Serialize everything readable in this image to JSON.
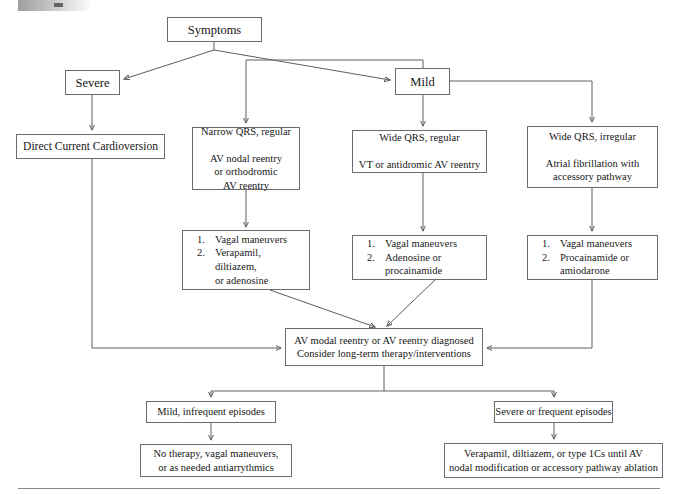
{
  "figure": {
    "domain": "clinical-algorithm-flowchart",
    "title_text": "",
    "footer_rule": true
  },
  "nodes": {
    "symptoms": {
      "label": "Symptoms"
    },
    "severe": {
      "label": "Severe"
    },
    "mild": {
      "label": "Mild"
    },
    "cardioversion": {
      "label": "Direct Current Cardioversion"
    },
    "narrow_qrs": {
      "label": "Narrow QRS, regular\n\nAV nodal reentry\nor orthodromic\nAV reentry"
    },
    "wide_qrs_regular": {
      "label": "Wide QRS, regular\n\nVT or antidromic AV reentry"
    },
    "wide_qrs_irregular": {
      "label": "Wide QRS, irregular\n\nAtrial fibrillation with\naccessory pathway"
    },
    "diagnosis": {
      "label": "AV modal reentry or AV reentry diagnosed\nConsider long-term therapy/interventions"
    },
    "mild_infrequent": {
      "label": "Mild, infrequent episodes"
    },
    "severe_frequent": {
      "label": "Severe or frequent episodes"
    },
    "no_therapy": {
      "label": "No therapy, vagal maneuvers,\nor as needed antiarrythmics"
    },
    "verapamil_ablation": {
      "label": "Verapamil, diltiazem, or type 1Cs until AV\nnodal modification or accessory pathway ablation"
    }
  },
  "therapy_lists": {
    "narrow_qrs_therapy": {
      "items": [
        {
          "num": "1.",
          "text": "Vagal maneuvers"
        },
        {
          "num": "2.",
          "text": "Verapamil,\ndiltiazem,\nor adenosine"
        }
      ]
    },
    "wide_regular_therapy": {
      "items": [
        {
          "num": "1.",
          "text": "Vagal maneuvers"
        },
        {
          "num": "2.",
          "text": "Adenosine or\nprocainamide"
        }
      ]
    },
    "wide_irregular_therapy": {
      "items": [
        {
          "num": "1.",
          "text": "Vagal maneuvers"
        },
        {
          "num": "2.",
          "text": "Procainamide or\namiodarone"
        }
      ]
    }
  },
  "colors": {
    "box_border": "#6b6b6b",
    "connector": "#5e5e5e",
    "text": "#161616",
    "background": "#ffffff",
    "rule": "#8a8a8a"
  }
}
